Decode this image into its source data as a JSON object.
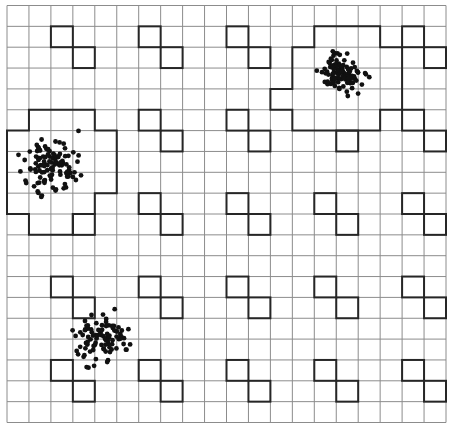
{
  "diagram": {
    "colors": {
      "background": "#ffffff",
      "grid_line": "#8c8c8c",
      "highlight_line": "#262626",
      "dot": "#111111"
    },
    "grid": {
      "left": 7,
      "top": 5.5,
      "cols": 20,
      "rows": 20,
      "cell_w": 21.95,
      "cell_h": 20.85
    },
    "highlighted_cells": [
      [
        2,
        1
      ],
      [
        3,
        2
      ],
      [
        6,
        1
      ],
      [
        7,
        2
      ],
      [
        10,
        1
      ],
      [
        11,
        2
      ],
      [
        18,
        1
      ],
      [
        19,
        2
      ],
      [
        6,
        5
      ],
      [
        7,
        6
      ],
      [
        10,
        5
      ],
      [
        11,
        6
      ],
      [
        15,
        6
      ],
      [
        18,
        5
      ],
      [
        19,
        6
      ],
      [
        3,
        10
      ],
      [
        6,
        9
      ],
      [
        7,
        10
      ],
      [
        10,
        9
      ],
      [
        11,
        10
      ],
      [
        14,
        9
      ],
      [
        15,
        10
      ],
      [
        18,
        9
      ],
      [
        19,
        10
      ],
      [
        2,
        13
      ],
      [
        3,
        14
      ],
      [
        6,
        13
      ],
      [
        7,
        14
      ],
      [
        10,
        13
      ],
      [
        11,
        14
      ],
      [
        14,
        13
      ],
      [
        15,
        14
      ],
      [
        18,
        13
      ],
      [
        19,
        14
      ],
      [
        2,
        17
      ],
      [
        3,
        18
      ],
      [
        6,
        17
      ],
      [
        7,
        18
      ],
      [
        10,
        17
      ],
      [
        11,
        18
      ],
      [
        14,
        17
      ],
      [
        15,
        18
      ],
      [
        18,
        17
      ],
      [
        19,
        18
      ]
    ],
    "regions": [
      {
        "name": "top-right-cluster-region",
        "rows": [
          {
            "row": 1,
            "from_col": 14,
            "to_col": 16
          },
          {
            "row": 2,
            "from_col": 13,
            "to_col": 17
          },
          {
            "row": 3,
            "from_col": 13,
            "to_col": 17
          },
          {
            "row": 4,
            "from_col": 12,
            "to_col": 17
          },
          {
            "row": 5,
            "from_col": 13,
            "to_col": 16
          }
        ]
      },
      {
        "name": "left-cluster-region",
        "rows": [
          {
            "row": 5,
            "from_col": 1,
            "to_col": 3
          },
          {
            "row": 6,
            "from_col": 0,
            "to_col": 4
          },
          {
            "row": 7,
            "from_col": 0,
            "to_col": 4
          },
          {
            "row": 8,
            "from_col": 0,
            "to_col": 4
          },
          {
            "row": 9,
            "from_col": 0,
            "to_col": 3
          },
          {
            "row": 10,
            "from_col": 1,
            "to_col": 2
          }
        ]
      }
    ],
    "clusters": [
      {
        "name": "cluster-top-right",
        "cx": 342,
        "cy": 73,
        "sx": 10,
        "sy": 9,
        "count": 110,
        "seed": 11
      },
      {
        "name": "cluster-left",
        "cx": 51,
        "cy": 168,
        "sx": 12,
        "sy": 12,
        "count": 115,
        "seed": 23
      },
      {
        "name": "cluster-bottom-left",
        "cx": 101,
        "cy": 339,
        "sx": 12,
        "sy": 11,
        "count": 95,
        "seed": 37
      }
    ],
    "dot_radius": 2.4
  }
}
